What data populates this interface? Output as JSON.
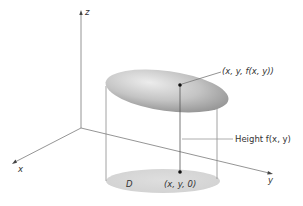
{
  "diagram": {
    "type": "3d-surface-over-region",
    "axes": {
      "z_label": "z",
      "x_label": "x",
      "y_label": "y"
    },
    "labels": {
      "top_point": "(x, y, f(x, y))",
      "height": "Height f(x, y)",
      "region": "D",
      "base_point": "(x, y, 0)"
    },
    "colors": {
      "axis": "#7a7a7a",
      "line": "#8a8a8a",
      "surface_light": "#e6e6e6",
      "surface_dark": "#9a9a9a",
      "region": "#d9d9d9",
      "point": "#111111",
      "text": "#333333"
    }
  }
}
